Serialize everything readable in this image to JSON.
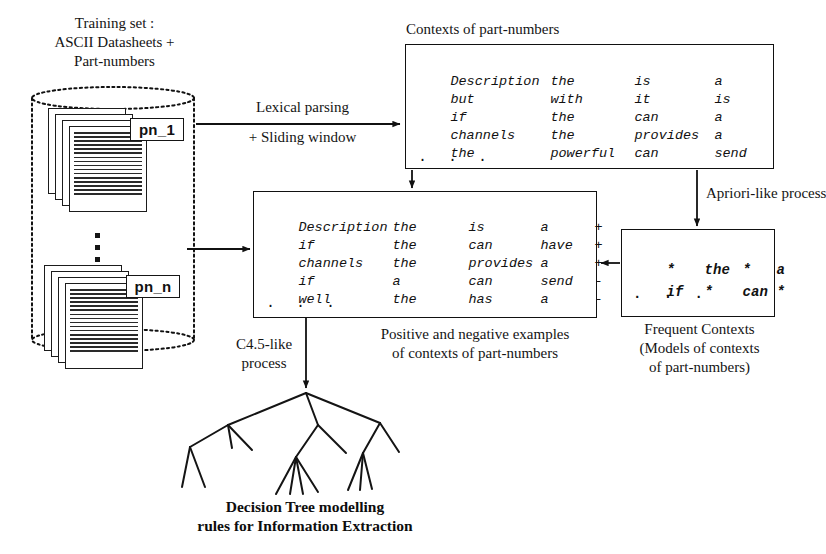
{
  "diagram": {
    "stroke_color": "#111111",
    "background": "#ffffff"
  },
  "training_set": {
    "caption": "Training set :\nASCII Datasheets +\nPart-numbers",
    "first_label": "pn_1",
    "last_label": "pn_n",
    "ellipsis": "vertical-ellipsis"
  },
  "arrows": {
    "lexical_parsing": "Lexical parsing",
    "sliding_window": "+ Sliding window",
    "apriori": "Apriori-like process",
    "c45": "C4.5-like\nprocess"
  },
  "contexts_box": {
    "caption": "Contexts of part-numbers",
    "rows": [
      [
        "Description",
        "the",
        "is",
        "a"
      ],
      [
        "but",
        "with",
        "it",
        "is"
      ],
      [
        "if",
        "the",
        "can",
        "a"
      ],
      [
        "channels",
        "the",
        "provides",
        "a"
      ],
      [
        "the",
        "powerful",
        "can",
        "send"
      ]
    ],
    "dots": ". . ."
  },
  "examples_box": {
    "caption": "Positive and negative examples\nof contexts of part-numbers",
    "rows": [
      [
        "Description",
        "the",
        "is",
        "a",
        "+"
      ],
      [
        "if",
        "the",
        "can",
        "have",
        "+"
      ],
      [
        "channels",
        "the",
        "provides",
        "a",
        "+"
      ],
      [
        "if",
        "a",
        "can",
        "send",
        "-"
      ],
      [
        "well",
        "the",
        "has",
        "a",
        "-"
      ]
    ],
    "dots": ". . ."
  },
  "frequent_box": {
    "caption": "Frequent Contexts\n(Models of contexts\nof part-numbers)",
    "rows": [
      [
        "*",
        "the",
        "*",
        "a"
      ],
      [
        "if",
        "*",
        "can",
        "*"
      ]
    ],
    "dots": ". . ."
  },
  "decision_tree": {
    "caption": "Decision Tree modelling\nrules for Information Extraction"
  }
}
